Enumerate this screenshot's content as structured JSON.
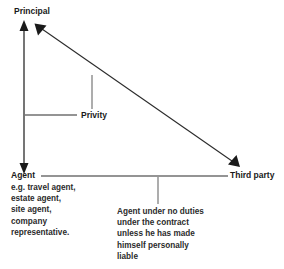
{
  "diagram": {
    "title_nodes": {
      "principal": "Principal",
      "agent": "Agent",
      "third_party": "Third party"
    },
    "agent_examples": [
      "e.g. travel agent,",
      "estate agent,",
      "site agent,",
      "company",
      "representative."
    ],
    "privity_label": "Privity",
    "caption_lines": [
      "Agent under no duties",
      "under the contract",
      "unless he has made",
      "himself personally",
      "liable"
    ],
    "colors": {
      "line": "#2b2b2b",
      "text": "#1a1a1a",
      "background": "#ffffff"
    }
  }
}
